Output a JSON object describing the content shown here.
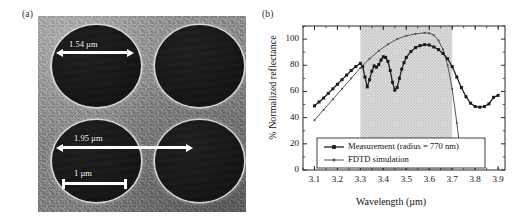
{
  "figure": {
    "panel_a_label": "(a)",
    "panel_b_label": "(b)"
  },
  "sem": {
    "hole_diameter": "1.54 µm",
    "pitch": "1.95 µm",
    "scale_bar": "1 µm",
    "icons": {
      "diameter_arrow": "double-arrow-icon",
      "pitch_arrow": "double-arrow-icon",
      "scale_bar": "scale-bar-icon"
    },
    "colors": {
      "background": "#8d8d8d",
      "hole": "#141414",
      "annotation": "#ffffff"
    }
  },
  "chart_data": {
    "type": "line",
    "title": "",
    "xlabel": "Wavelength (µm)",
    "ylabel": "% Normalized reflectance",
    "xlim": [
      3.05,
      3.93
    ],
    "ylim": [
      0,
      110
    ],
    "xticks": [
      3.1,
      3.2,
      3.3,
      3.4,
      3.5,
      3.6,
      3.7,
      3.8,
      3.9
    ],
    "xticklabels": [
      "3.1",
      "3.2",
      "3.3",
      "3.4",
      "3.5",
      "3.6",
      "3.7",
      "3.8",
      "3.9"
    ],
    "yticks": [
      0,
      20,
      40,
      60,
      80,
      100
    ],
    "yticklabels": [
      "0",
      "20",
      "40",
      "60",
      "80",
      "100"
    ],
    "grid": false,
    "legend_position": "lower center",
    "shaded_region": {
      "label": "",
      "x_start": 3.3,
      "x_end": 3.7,
      "color": "#d9d9d9",
      "hatch": "cross-hatch"
    },
    "series": [
      {
        "name": "Measurement (radius = 770 nm)",
        "color": "#1a1a1a",
        "marker": "square",
        "x": [
          3.1,
          3.12,
          3.14,
          3.16,
          3.18,
          3.2,
          3.22,
          3.24,
          3.26,
          3.28,
          3.3,
          3.31,
          3.32,
          3.33,
          3.34,
          3.35,
          3.36,
          3.37,
          3.38,
          3.39,
          3.4,
          3.41,
          3.42,
          3.43,
          3.44,
          3.45,
          3.46,
          3.47,
          3.48,
          3.49,
          3.5,
          3.52,
          3.54,
          3.56,
          3.58,
          3.6,
          3.62,
          3.64,
          3.66,
          3.68,
          3.7,
          3.72,
          3.74,
          3.76,
          3.78,
          3.8,
          3.82,
          3.84,
          3.86,
          3.88,
          3.9
        ],
        "y": [
          49.0,
          52.0,
          55.0,
          58.5,
          62.0,
          65.5,
          69.0,
          72.5,
          76.0,
          79.0,
          81.5,
          79.0,
          71.0,
          63.5,
          69.0,
          75.5,
          79.5,
          78.5,
          80.5,
          84.0,
          86.5,
          86.0,
          83.0,
          76.0,
          67.0,
          61.0,
          63.0,
          70.0,
          77.0,
          82.0,
          86.0,
          90.5,
          93.5,
          95.0,
          95.8,
          95.5,
          94.0,
          92.0,
          89.0,
          85.0,
          79.0,
          71.0,
          63.0,
          56.0,
          51.0,
          48.5,
          48.0,
          48.5,
          50.5,
          55.5,
          57.0
        ]
      },
      {
        "name": "FDTD simulation",
        "color": "#555555",
        "marker": "small-square",
        "x": [
          3.1,
          3.14,
          3.18,
          3.22,
          3.26,
          3.3,
          3.34,
          3.38,
          3.42,
          3.46,
          3.5,
          3.54,
          3.58,
          3.6,
          3.62,
          3.64,
          3.66,
          3.68,
          3.7,
          3.72,
          3.74
        ],
        "y": [
          38.0,
          46.0,
          54.0,
          62.0,
          70.0,
          78.0,
          85.0,
          91.0,
          96.0,
          100.0,
          102.5,
          104.0,
          104.8,
          104.5,
          103.0,
          99.0,
          92.0,
          80.0,
          62.0,
          36.0,
          8.0
        ]
      }
    ]
  }
}
